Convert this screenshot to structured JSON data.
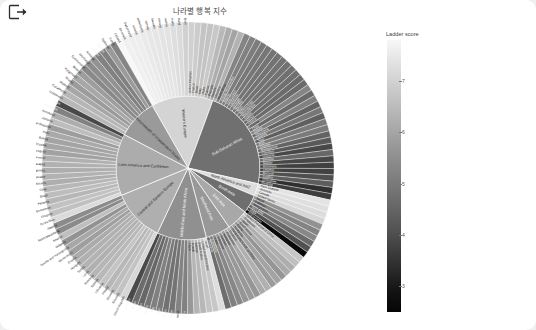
{
  "toolbar": {
    "logout_icon": "logout-export-icon"
  },
  "header": {
    "title": "나라별 행복 지수"
  },
  "legend": {
    "title": "Ladder score",
    "ticks": [
      "7",
      "6",
      "5",
      "4",
      "3"
    ],
    "position": "right",
    "orientation": "vertical",
    "colormap_light": "#f7f7f7",
    "colormap_dark": "#050505"
  },
  "chart_data": {
    "type": "pie",
    "subtype": "sunburst",
    "title": "나라별 행복 지수",
    "value_label": "Ladder score",
    "colorbar_range": [
      2.5,
      7.8
    ],
    "colorbar_ticks": [
      7,
      6,
      5,
      4,
      3
    ],
    "center": [
      186,
      172
    ],
    "inner_radius": 26,
    "ring1_radius": 72,
    "ring2_radius": 146,
    "regions": [
      {
        "name": "Western Europe",
        "label_color": "#2a2a2a",
        "mean_score": 6.91,
        "countries": [
          {
            "name": "Finland",
            "score": 7.84
          },
          {
            "name": "Denmark",
            "score": 7.62
          },
          {
            "name": "Switzerland",
            "score": 7.57
          },
          {
            "name": "Iceland",
            "score": 7.55
          },
          {
            "name": "Netherlands",
            "score": 7.46
          },
          {
            "name": "Norway",
            "score": 7.39
          },
          {
            "name": "Sweden",
            "score": 7.36
          },
          {
            "name": "Luxembourg",
            "score": 7.32
          },
          {
            "name": "Austria",
            "score": 7.27
          },
          {
            "name": "Germany",
            "score": 7.16
          },
          {
            "name": "Ireland",
            "score": 7.09
          },
          {
            "name": "Belgium",
            "score": 6.83
          },
          {
            "name": "United Kingdom",
            "score": 6.8
          },
          {
            "name": "France",
            "score": 6.69
          },
          {
            "name": "Spain",
            "score": 6.49
          },
          {
            "name": "Italy",
            "score": 6.48
          },
          {
            "name": "Malta",
            "score": 6.6
          },
          {
            "name": "Cyprus",
            "score": 6.22
          },
          {
            "name": "Portugal",
            "score": 5.93
          },
          {
            "name": "Greece",
            "score": 5.72
          }
        ]
      },
      {
        "name": "Sub-Saharan Africa",
        "label_color": "#ffffff",
        "mean_score": 4.49,
        "countries": [
          {
            "name": "Mauritius",
            "score": 6.05
          },
          {
            "name": "South Africa",
            "score": 4.95
          },
          {
            "name": "Congo (Brazzaville)",
            "score": 4.88
          },
          {
            "name": "Nigeria",
            "score": 4.76
          },
          {
            "name": "Ivory Coast",
            "score": 4.67
          },
          {
            "name": "Cameroon",
            "score": 4.63
          },
          {
            "name": "Senegal",
            "score": 4.58
          },
          {
            "name": "Namibia",
            "score": 4.57
          },
          {
            "name": "Niger",
            "score": 4.55
          },
          {
            "name": "Burkina Faso",
            "score": 4.53
          },
          {
            "name": "Mozambique",
            "score": 4.5
          },
          {
            "name": "Gabon",
            "score": 4.49
          },
          {
            "name": "Kenya",
            "score": 4.38
          },
          {
            "name": "Liberia",
            "score": 4.37
          },
          {
            "name": "Guinea",
            "score": 4.98
          },
          {
            "name": "Chad",
            "score": 4.36
          },
          {
            "name": "Ghana",
            "score": 4.89
          },
          {
            "name": "Mauritania",
            "score": 4.23
          },
          {
            "name": "Uganda",
            "score": 4.64
          },
          {
            "name": "Togo",
            "score": 4.11
          },
          {
            "name": "Mali",
            "score": 4.73
          },
          {
            "name": "Gambia",
            "score": 4.75
          },
          {
            "name": "Madagascar",
            "score": 4.21
          },
          {
            "name": "Comoros",
            "score": 3.98
          },
          {
            "name": "Tanzania",
            "score": 3.62
          },
          {
            "name": "Ethiopia",
            "score": 4.28
          },
          {
            "name": "Malawi",
            "score": 3.6
          },
          {
            "name": "Botswana",
            "score": 3.47
          },
          {
            "name": "Lesotho",
            "score": 3.51
          },
          {
            "name": "Burundi",
            "score": 3.78
          },
          {
            "name": "Zambia",
            "score": 4.07
          },
          {
            "name": "Zimbabwe",
            "score": 3.15
          },
          {
            "name": "Rwanda",
            "score": 3.41
          }
        ]
      },
      {
        "name": "North America and ANZ",
        "label_color": "#2a2a2a",
        "mean_score": 7.13,
        "countries": [
          {
            "name": "New Zealand",
            "score": 7.28
          },
          {
            "name": "Australia",
            "score": 7.18
          },
          {
            "name": "Canada",
            "score": 7.1
          },
          {
            "name": "United States",
            "score": 6.95
          }
        ]
      },
      {
        "name": "South Asia",
        "label_color": "#ffffff",
        "mean_score": 4.44,
        "countries": [
          {
            "name": "Nepal",
            "score": 5.27
          },
          {
            "name": "Pakistan",
            "score": 4.93
          },
          {
            "name": "Bangladesh",
            "score": 5.03
          },
          {
            "name": "Sri Lanka",
            "score": 4.33
          },
          {
            "name": "India",
            "score": 3.82
          },
          {
            "name": "Afghanistan",
            "score": 2.52
          }
        ]
      },
      {
        "name": "East Asia",
        "label_color": "#ffffff",
        "mean_score": 5.81,
        "countries": [
          {
            "name": "Taiwan Province of China",
            "score": 6.58
          },
          {
            "name": "Singapore",
            "score": 6.38
          },
          {
            "name": "Japan",
            "score": 5.94
          },
          {
            "name": "South Korea",
            "score": 5.85
          },
          {
            "name": "China",
            "score": 5.34
          },
          {
            "name": "Mongolia",
            "score": 5.68
          },
          {
            "name": "Hong Kong S.A.R. of China",
            "score": 5.48
          }
        ]
      },
      {
        "name": "Southeast Asia",
        "label_color": "#ffffff",
        "mean_score": 5.41,
        "countries": [
          {
            "name": "Thailand",
            "score": 5.99
          },
          {
            "name": "Philippines",
            "score": 5.88
          },
          {
            "name": "Malaysia",
            "score": 5.38
          },
          {
            "name": "Vietnam",
            "score": 5.41
          },
          {
            "name": "Indonesia",
            "score": 5.35
          },
          {
            "name": "Laos",
            "score": 5.03
          },
          {
            "name": "Cambodia",
            "score": 4.83
          },
          {
            "name": "Myanmar",
            "score": 4.43
          }
        ]
      },
      {
        "name": "Middle East and North Africa",
        "label_color": "#ffffff",
        "mean_score": 5.22,
        "countries": [
          {
            "name": "Israel",
            "score": 7.16
          },
          {
            "name": "United Arab Emirates",
            "score": 6.56
          },
          {
            "name": "Saudi Arabia",
            "score": 6.49
          },
          {
            "name": "Bahrain",
            "score": 6.17
          },
          {
            "name": "Kuwait",
            "score": 6.11
          },
          {
            "name": "Libya",
            "score": 5.41
          },
          {
            "name": "Algeria",
            "score": 4.89
          },
          {
            "name": "Morocco",
            "score": 4.92
          },
          {
            "name": "Lebanon",
            "score": 4.58
          },
          {
            "name": "Palestinian Territories",
            "score": 4.52
          },
          {
            "name": "Iran",
            "score": 4.72
          },
          {
            "name": "Iraq",
            "score": 4.85
          },
          {
            "name": "Tunisia",
            "score": 4.6
          },
          {
            "name": "Egypt",
            "score": 4.28
          },
          {
            "name": "Jordan",
            "score": 4.4
          },
          {
            "name": "Yemen",
            "score": 3.66
          }
        ]
      },
      {
        "name": "Central and Eastern Europe",
        "label_color": "#2a2a2a",
        "mean_score": 5.98,
        "countries": [
          {
            "name": "Czech Republic",
            "score": 6.97
          },
          {
            "name": "Slovenia",
            "score": 6.46
          },
          {
            "name": "Slovakia",
            "score": 6.33
          },
          {
            "name": "Poland",
            "score": 6.17
          },
          {
            "name": "Lithuania",
            "score": 6.49
          },
          {
            "name": "Estonia",
            "score": 6.19
          },
          {
            "name": "Romania",
            "score": 6.14
          },
          {
            "name": "Latvia",
            "score": 6.01
          },
          {
            "name": "Serbia",
            "score": 6.08
          },
          {
            "name": "Hungary",
            "score": 5.99
          },
          {
            "name": "Croatia",
            "score": 5.88
          },
          {
            "name": "Montenegro",
            "score": 5.58
          },
          {
            "name": "Bosnia and Herzegovina",
            "score": 5.81
          },
          {
            "name": "Bulgaria",
            "score": 5.27
          },
          {
            "name": "Kosovo",
            "score": 6.37
          },
          {
            "name": "North Macedonia",
            "score": 5.1
          },
          {
            "name": "Albania",
            "score": 5.12
          }
        ]
      },
      {
        "name": "Latin America and Caribbean",
        "label_color": "#2a2a2a",
        "mean_score": 5.91,
        "countries": [
          {
            "name": "Costa Rica",
            "score": 7.07
          },
          {
            "name": "Uruguay",
            "score": 6.43
          },
          {
            "name": "Guatemala",
            "score": 6.44
          },
          {
            "name": "Panama",
            "score": 6.18
          },
          {
            "name": "Brazil",
            "score": 6.33
          },
          {
            "name": "Chile",
            "score": 6.17
          },
          {
            "name": "Mexico",
            "score": 5.96
          },
          {
            "name": "El Salvador",
            "score": 6.06
          },
          {
            "name": "Argentina",
            "score": 5.93
          },
          {
            "name": "Nicaragua",
            "score": 6.02
          },
          {
            "name": "Colombia",
            "score": 6.01
          },
          {
            "name": "Paraguay",
            "score": 5.65
          },
          {
            "name": "Ecuador",
            "score": 5.76
          },
          {
            "name": "Bolivia",
            "score": 5.72
          },
          {
            "name": "Peru",
            "score": 5.84
          },
          {
            "name": "Dominican Republic",
            "score": 5.55
          },
          {
            "name": "Jamaica",
            "score": 6.31
          },
          {
            "name": "Honduras",
            "score": 5.92
          },
          {
            "name": "Venezuela",
            "score": 4.89
          },
          {
            "name": "Haiti",
            "score": 3.62
          }
        ]
      },
      {
        "name": "Commonwealth of Independent States",
        "label_color": "#2a2a2a",
        "mean_score": 5.47,
        "countries": [
          {
            "name": "Uzbekistan",
            "score": 6.18
          },
          {
            "name": "Kazakhstan",
            "score": 6.15
          },
          {
            "name": "Moldova",
            "score": 5.77
          },
          {
            "name": "Russia",
            "score": 5.48
          },
          {
            "name": "Kyrgyzstan",
            "score": 5.77
          },
          {
            "name": "Belarus",
            "score": 5.53
          },
          {
            "name": "Turkmenistan",
            "score": 5.07
          },
          {
            "name": "Azerbaijan",
            "score": 5.17
          },
          {
            "name": "Armenia",
            "score": 5.28
          },
          {
            "name": "Ukraine",
            "score": 4.88
          },
          {
            "name": "Georgia",
            "score": 4.89
          },
          {
            "name": "Tajikistan",
            "score": 5.47
          },
          {
            "name": "Turkey",
            "score": 4.95
          }
        ]
      }
    ]
  }
}
